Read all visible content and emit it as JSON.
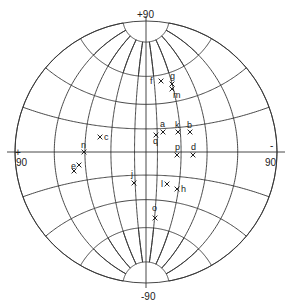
{
  "net": {
    "type": "stereographic net",
    "center": [
      146,
      152
    ],
    "radius": 131,
    "grid_step_deg": 20,
    "line_color": "#333333"
  },
  "axis_labels": {
    "top": "+90",
    "bottom": "-90",
    "left": "+90",
    "left_sign": "+",
    "left_value": "90",
    "right": "-90",
    "right_sign": "-",
    "right_value": "90"
  },
  "points": [
    {
      "label": "f",
      "x": 161,
      "y": 81,
      "lx": 150,
      "ly": 84
    },
    {
      "label": "g",
      "x": 172,
      "y": 84,
      "lx": 170,
      "ly": 79
    },
    {
      "label": "m",
      "x": 172,
      "y": 89,
      "lx": 173,
      "ly": 98
    },
    {
      "label": "a",
      "x": 163,
      "y": 132,
      "lx": 160,
      "ly": 127
    },
    {
      "label": "q",
      "x": 156,
      "y": 135,
      "lx": 153,
      "ly": 144
    },
    {
      "label": "k",
      "x": 178,
      "y": 132,
      "lx": 175,
      "ly": 128
    },
    {
      "label": "b",
      "x": 190,
      "y": 132,
      "lx": 187,
      "ly": 128
    },
    {
      "label": "p",
      "x": 177,
      "y": 155,
      "lx": 175,
      "ly": 150
    },
    {
      "label": "d",
      "x": 193,
      "y": 155,
      "lx": 191,
      "ly": 150
    },
    {
      "label": "c",
      "x": 100,
      "y": 137,
      "lx": 104,
      "ly": 140
    },
    {
      "label": "n",
      "x": 84,
      "y": 152,
      "lx": 81,
      "ly": 148
    },
    {
      "label": "e",
      "x": 79,
      "y": 165,
      "lx": 71,
      "ly": 169
    },
    {
      "label": "i",
      "x": 74,
      "y": 171,
      "lx": 0,
      "ly": 0
    },
    {
      "label": "j",
      "x": 134,
      "y": 183,
      "lx": 131,
      "ly": 177
    },
    {
      "label": "l",
      "x": 167,
      "y": 184,
      "lx": 161,
      "ly": 187
    },
    {
      "label": "h",
      "x": 177,
      "y": 189,
      "lx": 181,
      "ly": 192
    },
    {
      "label": "o",
      "x": 155,
      "y": 218,
      "lx": 152,
      "ly": 211
    }
  ]
}
